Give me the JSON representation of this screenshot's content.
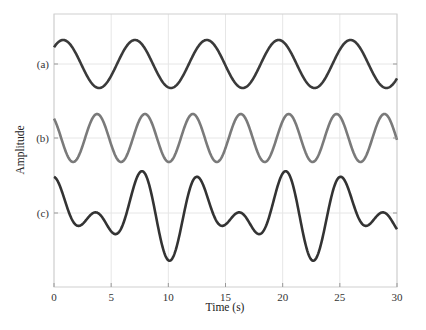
{
  "chart_data": {
    "type": "line",
    "title": "",
    "xlabel": "Time (s)",
    "ylabel": "Amplitude",
    "xlim": [
      0,
      30
    ],
    "xticks": [
      0,
      5,
      10,
      15,
      20,
      25,
      30
    ],
    "xtick_labels": [
      "0",
      "5",
      "10",
      "15",
      "20",
      "25",
      "30"
    ],
    "ytick_labels": [
      "(a)",
      "(b)",
      "(c)"
    ],
    "grid": true,
    "legend": null,
    "x": [
      0,
      1,
      2,
      3,
      4,
      5,
      6,
      7,
      8,
      9,
      10,
      11,
      12,
      13,
      14,
      15,
      16,
      17,
      18,
      19,
      20,
      21,
      22,
      23,
      24,
      25,
      26,
      27,
      28,
      29,
      30
    ],
    "series": [
      {
        "name": "(a)",
        "color": "#3a3a3a",
        "baseline_offset": 0,
        "model": {
          "terms": [
            {
              "amp": 1,
              "omega": 1.0,
              "phase": -0.8
            }
          ]
        },
        "values": [
          0.7,
          0.98,
          0.36,
          -0.59,
          -1.0,
          -0.49,
          0.47,
          1.0,
          0.61,
          -0.34,
          -0.97,
          -0.71,
          0.22,
          0.94,
          0.79,
          -0.09,
          -0.87,
          -0.89,
          -0.06,
          0.8,
          0.94,
          0.2,
          -0.7,
          -0.98,
          -0.35,
          0.6,
          1.0,
          0.48,
          -0.48,
          -1.0,
          -0.6
        ]
      },
      {
        "name": "(b)",
        "color": "#7a7a7a",
        "baseline_offset": 0,
        "model": {
          "terms": [
            {
              "amp": 1,
              "omega": 1.5,
              "phase": 0.63
            }
          ]
        },
        "values": [
          0.81,
          -0.53,
          -0.88,
          0.41,
          0.94,
          -0.28,
          -0.98,
          0.14,
          1.0,
          0.0,
          -1.0,
          -0.14,
          0.98,
          0.28,
          -0.94,
          -0.41,
          0.88,
          0.53,
          -0.81,
          -0.64,
          0.73,
          0.74,
          -0.63,
          -0.82,
          0.52,
          0.89,
          -0.4,
          -0.94,
          0.27,
          0.98,
          -0.13
        ]
      },
      {
        "name": "(c)",
        "color": "#333333",
        "baseline_offset": 0,
        "model": {
          "terms": [
            {
              "amp": 1,
              "omega": 1.0,
              "phase": -0.8
            },
            {
              "amp": 1,
              "omega": 1.5,
              "phase": 0.63
            }
          ]
        },
        "values": [
          1.51,
          0.45,
          -0.52,
          -0.18,
          -0.06,
          -0.77,
          -0.51,
          1.14,
          1.61,
          -0.34,
          -1.97,
          -0.85,
          1.2,
          1.22,
          -0.15,
          -0.5,
          0.01,
          -0.36,
          -0.87,
          0.16,
          1.67,
          0.94,
          -1.33,
          -1.8,
          0.17,
          1.49,
          0.6,
          -0.46,
          -0.21,
          -0.02,
          -0.73
        ]
      }
    ],
    "layout": {
      "plot_left": 54,
      "plot_right": 397,
      "plot_top": 14,
      "plot_bottom": 287,
      "baselines_px": [
        64,
        138,
        213
      ],
      "unit_px": 24,
      "grid_color": "#e6e6e6",
      "frame_color": "#cfcfcf"
    }
  }
}
